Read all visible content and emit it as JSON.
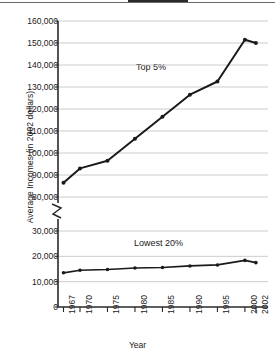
{
  "chart_data": {
    "type": "line",
    "title": "",
    "xlabel": "Year",
    "ylabel": "Average Incomes (in 2002 dollars)",
    "x": [
      1967,
      1970,
      1975,
      1980,
      1985,
      1990,
      1995,
      2000,
      2002
    ],
    "categories": [
      "1967",
      "1970",
      "1975",
      "1980",
      "1985",
      "1990",
      "1995",
      "2000",
      "2002"
    ],
    "series": [
      {
        "name": "Top 5%",
        "values": [
          86500,
          93000,
          96500,
          106500,
          116500,
          126500,
          132500,
          151500,
          150000
        ]
      },
      {
        "name": "Lowest 20%",
        "values": [
          13500,
          14500,
          14800,
          15400,
          15600,
          16200,
          16600,
          18400,
          17500
        ]
      }
    ],
    "y_ticks_upper": [
      "80,000",
      "90,000",
      "100,000",
      "110,000",
      "120,000",
      "130,000",
      "140,000",
      "150,000",
      "160,000"
    ],
    "y_ticks_lower": [
      "0",
      "10,000",
      "20,000",
      "30,000"
    ],
    "ylim_upper": [
      80000,
      160000
    ],
    "ylim_lower": [
      0,
      30000
    ],
    "axis_break": true,
    "grid": true,
    "legend_position": "inline-annotation",
    "annotations": [
      {
        "text": "Top 5%",
        "x": 1983,
        "series": "Top 5%"
      },
      {
        "text": "Lowest 20%",
        "x": 1984,
        "series": "Lowest 20%"
      }
    ],
    "colors": {
      "line": "#1a1a1a",
      "grid": "#bfbfbf",
      "axis": "#2a2a2a",
      "background": "#ffffff"
    }
  },
  "axis_titles": {
    "y": "Average Incomes (in 2002 dollars)",
    "x": "Year"
  }
}
